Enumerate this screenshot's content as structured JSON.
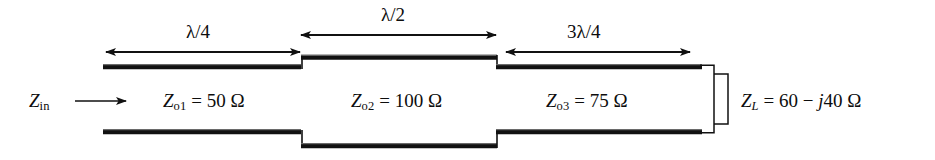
{
  "figure": {
    "kind": "transmission-line-cascade-schematic",
    "dimensions": {
      "section1": "λ/4",
      "section2": "λ/2",
      "section3": "3λ/4"
    },
    "input": {
      "symbol": "Z",
      "subscript": "in",
      "arrow": "right-arrow"
    },
    "lines": [
      {
        "symbol": "Z",
        "subscript": "o1",
        "equals": "=",
        "value": "50",
        "unit": "Ω"
      },
      {
        "symbol": "Z",
        "subscript": "o2",
        "equals": "=",
        "value": "100",
        "unit": "Ω"
      },
      {
        "symbol": "Z",
        "subscript": "o3",
        "equals": "=",
        "value": "75",
        "unit": "Ω"
      }
    ],
    "load": {
      "symbol": "Z",
      "subscript": "L",
      "equals": "=",
      "real": "60",
      "sign": "−",
      "imag_unit": "j",
      "imag": "40",
      "unit": "Ω"
    },
    "colors": {
      "conductor": "#111111",
      "background": "#ffffff",
      "text": "#0d0d0d"
    }
  }
}
